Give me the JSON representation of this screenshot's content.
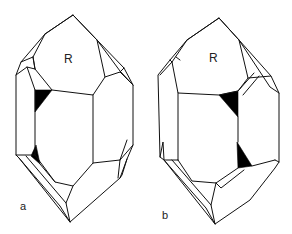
{
  "figure": {
    "colors": {
      "line": "#111111",
      "fill_dark": "#000000",
      "background": "#ffffff"
    },
    "panels": [
      {
        "id": "a",
        "panel_label": "a",
        "face_label": "R"
      },
      {
        "id": "b",
        "panel_label": "b",
        "face_label": "R"
      }
    ]
  }
}
